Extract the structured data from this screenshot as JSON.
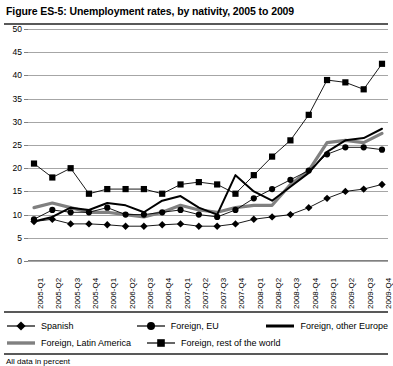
{
  "figure": {
    "title": "Figure ES-5:  Unemployment rates, by nativity, 2005 to 2009",
    "note": "All data in percent"
  },
  "legend": {
    "items": [
      {
        "label": "Spanish",
        "marker": "diamond-marker-icon"
      },
      {
        "label": "Foreign, EU",
        "marker": "circle-marker-icon"
      },
      {
        "label": "Foreign, other Europe",
        "marker": "thick-black-line-icon"
      },
      {
        "label": "Foreign, Latin America",
        "marker": "thick-gray-line-icon"
      },
      {
        "label": "Foreign, rest of the world",
        "marker": "square-marker-icon"
      }
    ]
  },
  "chart_data": {
    "type": "line",
    "title": "Figure ES-5:  Unemployment rates, by nativity, 2005 to 2009",
    "xlabel": "",
    "ylabel": "",
    "ylim": [
      0,
      50
    ],
    "ytick_step": 5,
    "yticks": [
      0,
      5,
      10,
      15,
      20,
      25,
      30,
      35,
      40,
      45,
      50
    ],
    "grid": true,
    "legend_position": "bottom",
    "units": "percent",
    "categories": [
      "2005-Q1",
      "2005-Q2",
      "2005-Q3",
      "2005-Q4",
      "2006-Q1",
      "2006-Q2",
      "2006-Q3",
      "2006-Q4",
      "2007-Q1",
      "2007-Q2",
      "2007-Q3",
      "2007-Q4",
      "2008-Q1",
      "2008-Q2",
      "2008-Q3",
      "2008-Q4",
      "2009-Q1",
      "2009-Q2",
      "2009-Q3",
      "2009-Q4"
    ],
    "series": [
      {
        "name": "Spanish",
        "marker": "diamond",
        "color": "#000000",
        "values": [
          8.5,
          9.0,
          8.0,
          8.0,
          7.8,
          7.5,
          7.5,
          7.8,
          8.0,
          7.5,
          7.5,
          8.0,
          9.0,
          9.5,
          10.0,
          11.5,
          13.5,
          15.0,
          15.5,
          16.5
        ]
      },
      {
        "name": "Foreign, EU",
        "marker": "circle",
        "color": "#000000",
        "values": [
          9.0,
          11.0,
          10.5,
          10.5,
          11.5,
          10.0,
          10.0,
          10.5,
          11.0,
          10.0,
          9.5,
          11.0,
          13.5,
          15.5,
          17.5,
          19.5,
          23.0,
          24.5,
          24.5,
          24.0
        ]
      },
      {
        "name": "Foreign, other Europe",
        "marker": "line",
        "color": "#000000",
        "values": [
          8.5,
          9.5,
          11.5,
          11.0,
          12.5,
          12.0,
          10.5,
          13.0,
          14.0,
          11.5,
          10.0,
          18.5,
          15.0,
          13.0,
          16.0,
          19.0,
          23.5,
          26.0,
          26.5,
          28.5
        ]
      },
      {
        "name": "Foreign, Latin America",
        "marker": "thickline",
        "color": "#808080",
        "values": [
          11.5,
          12.5,
          11.5,
          10.5,
          10.5,
          10.0,
          9.5,
          10.5,
          12.0,
          11.0,
          10.5,
          11.5,
          12.0,
          12.0,
          16.5,
          19.5,
          25.5,
          26.0,
          25.5,
          27.5
        ]
      },
      {
        "name": "Foreign, rest of the world",
        "marker": "square",
        "color": "#000000",
        "values": [
          21.0,
          18.0,
          20.0,
          14.5,
          15.5,
          15.5,
          15.5,
          14.5,
          16.5,
          17.0,
          16.5,
          14.5,
          18.5,
          22.5,
          26.0,
          31.5,
          39.0,
          38.5,
          37.0,
          42.5
        ]
      }
    ]
  }
}
